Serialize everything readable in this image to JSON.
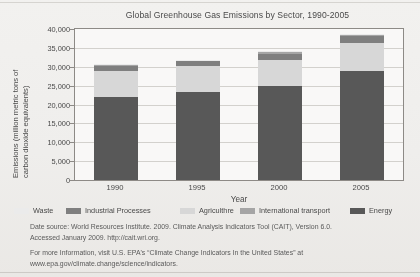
{
  "chart_data": {
    "type": "bar",
    "stacked": true,
    "title": "Global Greenhouse Gas Emissions by Sector, 1990-2005",
    "xlabel": "Year",
    "ylabel": "Emissions (million metric tons of carbon dioxide equivalents)",
    "ylabel_line1": "Emissions (million metric tons of",
    "ylabel_line2": "carbon dioxide equivalents)",
    "categories": [
      "1990",
      "1995",
      "2000",
      "2005"
    ],
    "ylim": [
      0,
      40000
    ],
    "yticks": [
      "0",
      "5,000",
      "10,000",
      "15,000",
      "20,000",
      "25,000",
      "30,000",
      "35,000",
      "40,000"
    ],
    "ytick_values": [
      0,
      5000,
      10000,
      15000,
      20000,
      25000,
      30000,
      35000,
      40000
    ],
    "grid": true,
    "legend_position": "bottom",
    "series": [
      {
        "name": "Energy",
        "color": "#595959",
        "values": [
          22000,
          23400,
          24800,
          29000
        ]
      },
      {
        "name": "Agriculture",
        "color": "#d9d9d9",
        "values": [
          6800,
          6700,
          7000,
          7200
        ]
      },
      {
        "name": "Industrial Processes",
        "color": "#808080",
        "values": [
          1500,
          1300,
          1700,
          1900
        ]
      },
      {
        "name": "International transport",
        "color": "#a6a6a6",
        "values": [
          300,
          300,
          350,
          400
        ]
      },
      {
        "name": "Waste",
        "color": "#ededed",
        "values": [
          200,
          200,
          250,
          300
        ]
      }
    ],
    "totals": [
      30800,
      31900,
      34100,
      38800
    ]
  },
  "legend": {
    "items": [
      {
        "label": "Waste",
        "color": "#ededed"
      },
      {
        "label": "Industrial Processes",
        "color": "#808080"
      },
      {
        "label": "Agriculthre",
        "color": "#d9d9d9"
      },
      {
        "label": "International transport",
        "color": "#a6a6a6"
      },
      {
        "label": "Energy",
        "color": "#595959"
      }
    ]
  },
  "notes": {
    "source_line1": "Date source: World Resources Institute. 2009. Climate Analysis Indicators Tool (CAIT), Version 6.0.",
    "source_line2": "Accessed January 2009. http://cait.wri.org.",
    "more_line1": "For more Information, visit U.S. EPA's “Climate Change Indicators In the United States” at",
    "more_line2": "www.epa.gov/climate.change/sclence/indicators."
  }
}
